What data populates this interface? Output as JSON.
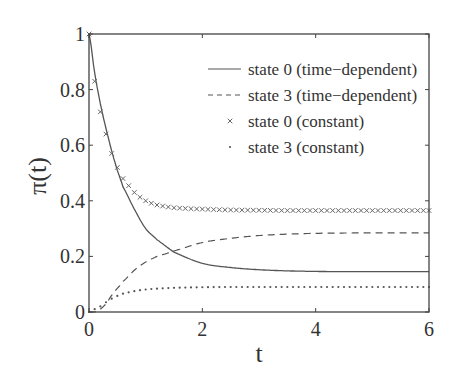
{
  "chart_data": {
    "type": "line",
    "title": "",
    "xlabel": "t",
    "ylabel": "π(t)",
    "xlim": [
      0,
      6
    ],
    "ylim": [
      0,
      1
    ],
    "xticks": [
      0,
      2,
      4,
      6
    ],
    "xtick_labels": [
      "0",
      "2",
      "4",
      "6"
    ],
    "yticks": [
      0,
      0.2,
      0.4,
      0.6,
      0.8,
      1
    ],
    "ytick_labels": [
      "0",
      "0.2",
      "0.4",
      "0.6",
      "0.8",
      "1"
    ],
    "grid": false,
    "legend_position": "upper right (inside)",
    "x": [
      0,
      0.1,
      0.2,
      0.3,
      0.4,
      0.5,
      0.6,
      0.8,
      1.0,
      1.2,
      1.5,
      2.0,
      2.5,
      3.0,
      3.5,
      4.0,
      4.5,
      5.0,
      5.5,
      6.0
    ],
    "series": [
      {
        "name": "state 0 (time−dependent)",
        "style": "solid",
        "values": [
          1.0,
          0.86,
          0.75,
          0.66,
          0.58,
          0.51,
          0.45,
          0.37,
          0.3,
          0.26,
          0.215,
          0.175,
          0.16,
          0.152,
          0.148,
          0.146,
          0.145,
          0.145,
          0.145,
          0.145
        ]
      },
      {
        "name": "state 3 (time−dependent)",
        "style": "dashed",
        "values": [
          0.0,
          0.0,
          0.01,
          0.03,
          0.06,
          0.085,
          0.11,
          0.15,
          0.18,
          0.2,
          0.22,
          0.25,
          0.265,
          0.275,
          0.28,
          0.283,
          0.284,
          0.285,
          0.285,
          0.285
        ]
      },
      {
        "name": "state 0 (constant)",
        "style": "x-markers",
        "values": [
          1.0,
          0.83,
          0.72,
          0.64,
          0.57,
          0.52,
          0.48,
          0.43,
          0.4,
          0.385,
          0.375,
          0.37,
          0.367,
          0.366,
          0.365,
          0.365,
          0.365,
          0.365,
          0.365,
          0.365
        ]
      },
      {
        "name": "state 3 (constant)",
        "style": "dotted",
        "values": [
          0.0,
          0.01,
          0.02,
          0.035,
          0.048,
          0.058,
          0.066,
          0.075,
          0.081,
          0.084,
          0.087,
          0.089,
          0.09,
          0.09,
          0.09,
          0.09,
          0.09,
          0.09,
          0.09,
          0.09
        ]
      }
    ],
    "colors": {
      "line": "#555555",
      "axes": "#444444",
      "background": "#ffffff"
    }
  }
}
